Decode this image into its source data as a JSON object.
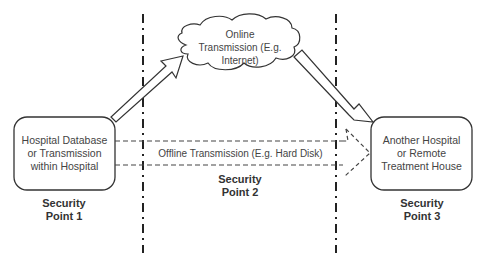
{
  "diagram": {
    "source_box": {
      "lines": [
        "Hospital Database",
        "or Transmission",
        "within Hospital"
      ]
    },
    "dest_box": {
      "lines": [
        "Another Hospital",
        "or Remote",
        "Treatment House"
      ]
    },
    "cloud": {
      "lines": [
        "Online",
        "Transmission (E.g.",
        "Internet)"
      ]
    },
    "offline_label": "Offline Transmission (E.g. Hard Disk)",
    "security_points": [
      {
        "line1": "Security",
        "line2": "Point 1"
      },
      {
        "line1": "Security",
        "line2": "Point 2"
      },
      {
        "line1": "Security",
        "line2": "Point 3"
      }
    ]
  }
}
